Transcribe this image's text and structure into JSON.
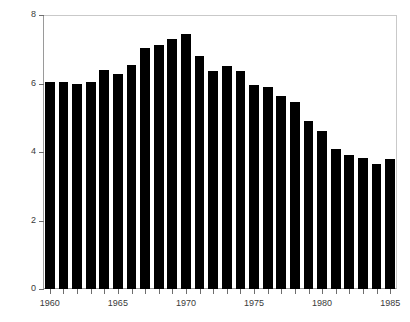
{
  "chart_data": {
    "type": "bar",
    "title": "",
    "subtitle": "",
    "xlabel": "",
    "ylabel": "",
    "categories": [
      "1960",
      "1961",
      "1962",
      "1963",
      "1964",
      "1965",
      "1966",
      "1967",
      "1968",
      "1969",
      "1970",
      "1971",
      "1972",
      "1973",
      "1974",
      "1975",
      "1976",
      "1977",
      "1978",
      "1979",
      "1980",
      "1981",
      "1982",
      "1983",
      "1984",
      "1985"
    ],
    "values": [
      6.05,
      6.03,
      6.0,
      6.03,
      6.4,
      6.28,
      6.55,
      7.05,
      7.13,
      7.3,
      7.45,
      6.8,
      6.38,
      6.52,
      6.38,
      5.97,
      5.9,
      5.65,
      5.45,
      4.9,
      4.6,
      4.1,
      3.9,
      3.82,
      3.65,
      3.8
    ],
    "ylim": [
      0,
      8
    ],
    "yticks": [
      0,
      2,
      4,
      6,
      8
    ],
    "ytick_labels": [
      "0",
      "2",
      "4",
      "6",
      "8"
    ],
    "xlim": [
      1959.5,
      1985.5
    ],
    "xticks": [
      1960,
      1965,
      1970,
      1975,
      1980,
      1985
    ],
    "xtick_labels": [
      "1960",
      "1965",
      "1970",
      "1975",
      "1980",
      "1985"
    ],
    "xtick_minor_years": [
      1960,
      1961,
      1962,
      1963,
      1964,
      1965,
      1966,
      1967,
      1968,
      1969,
      1970,
      1971,
      1972,
      1973,
      1974,
      1975,
      1976,
      1977,
      1978,
      1979,
      1980,
      1981,
      1982,
      1983,
      1984,
      1985
    ],
    "grid": false,
    "legend": null,
    "bar_color": "#000000",
    "axis_color": "#6e6e6e",
    "frame_color": "#c9c9c9",
    "background_color": "#ffffff",
    "annotations": []
  }
}
